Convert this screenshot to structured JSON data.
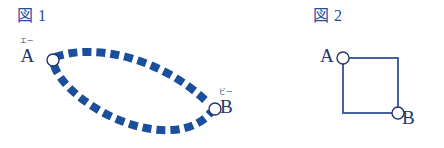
{
  "page": {
    "background_color": "#ffffff",
    "width": 444,
    "height": 148
  },
  "palette": {
    "figure_caption_blue": "#1f4e9c",
    "path_blue": "#1b4e9b",
    "square_blue": "#46629f",
    "label_navy": "#23356b",
    "node_fill": "#ffffff"
  },
  "figures": [
    {
      "id": "fig1",
      "caption": "図 1",
      "type": "lens-shape-two-curves",
      "description": "Two thick dashed blue curves bowing apart, joining node A to node B to form a lens/leaf outline",
      "nodes": [
        {
          "id": "A",
          "label": "A",
          "ruby": "エー",
          "cx": 53,
          "cy": 60,
          "r": 6
        },
        {
          "id": "B",
          "label": "B",
          "ruby": "ビー",
          "cx": 215,
          "cy": 109,
          "r": 6
        }
      ],
      "edges": [
        {
          "from": "A",
          "to": "B",
          "style": "thick-dashed",
          "bow": "upper"
        },
        {
          "from": "A",
          "to": "B",
          "style": "thick-dashed",
          "bow": "lower"
        }
      ]
    },
    {
      "id": "fig2",
      "caption": "図 2",
      "type": "square-path",
      "description": "Square outline with node A at the top-left corner and node B at the bottom-right corner",
      "nodes": [
        {
          "id": "A",
          "label": "A",
          "cx": 93,
          "cy": 58,
          "r": 6
        },
        {
          "id": "B",
          "label": "B",
          "cx": 148,
          "cy": 113,
          "r": 6
        }
      ],
      "edges": [
        {
          "from": "A",
          "to": "B",
          "style": "solid",
          "route": "top-right"
        },
        {
          "from": "A",
          "to": "B",
          "style": "solid",
          "route": "left-bottom"
        }
      ]
    }
  ]
}
